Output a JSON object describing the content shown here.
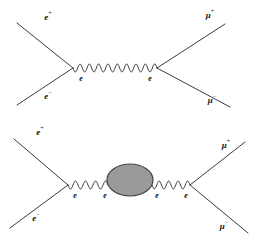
{
  "figure": {
    "width": 258,
    "height": 243,
    "background": "#ffffff",
    "line_color": "#3a3a44",
    "blob_fill": "#9a9a9a",
    "blob_stroke": "#444444",
    "label_color": "#111111"
  },
  "diagrams": [
    {
      "id": "tree-level",
      "name": "tree-level-annihilation",
      "description": "e+ e- annihilation to mu+ mu- via single photon exchange",
      "external_labels": [
        {
          "name": "incoming-positron",
          "base": "e",
          "charge": "+",
          "x": 48,
          "y": 18
        },
        {
          "name": "incoming-electron",
          "base": "e",
          "charge": "−",
          "x": 48,
          "y": 97
        },
        {
          "name": "outgoing-antimuon",
          "base": "μ",
          "charge": "+",
          "x": 210,
          "y": 16
        },
        {
          "name": "outgoing-muon",
          "base": "μ",
          "charge": "−",
          "x": 212,
          "y": 101
        }
      ],
      "vertex_labels": [
        {
          "name": "left-vertex-label",
          "base": "e",
          "charge": "",
          "x": 81,
          "y": 79
        },
        {
          "name": "right-vertex-label",
          "base": "e",
          "charge": "",
          "x": 150,
          "y": 79
        }
      ],
      "fermion_lines": [
        {
          "name": "positron-in-line",
          "x1": 17,
          "y1": 23,
          "x2": 73,
          "y2": 68
        },
        {
          "name": "electron-in-line",
          "x1": 17,
          "y1": 105,
          "x2": 73,
          "y2": 68
        },
        {
          "name": "antimuon-out-line",
          "x1": 157,
          "y1": 68,
          "x2": 225,
          "y2": 24
        },
        {
          "name": "muon-out-line",
          "x1": 157,
          "y1": 68,
          "x2": 230,
          "y2": 107
        }
      ],
      "photon": {
        "name": "photon-propagator",
        "x1": 73,
        "y1": 68,
        "x2": 157,
        "y2": 68,
        "cycles": 9,
        "amplitude": 4
      },
      "vertices": [
        {
          "name": "left-vertex",
          "x": 73,
          "y": 68
        },
        {
          "name": "right-vertex",
          "x": 157,
          "y": 68
        }
      ]
    },
    {
      "id": "loop-corrected",
      "name": "vacuum-polarization-correction",
      "description": "e+ e- to mu+ mu- with a blob insertion in the photon propagator",
      "external_labels": [
        {
          "name": "incoming-positron",
          "base": "e",
          "charge": "+",
          "x": 40,
          "y": 133
        },
        {
          "name": "incoming-electron",
          "base": "e",
          "charge": "−",
          "x": 36,
          "y": 219
        },
        {
          "name": "outgoing-antimuon",
          "base": "μ",
          "charge": "+",
          "x": 226,
          "y": 146
        },
        {
          "name": "outgoing-muon",
          "base": "μ",
          "charge": "−",
          "x": 224,
          "y": 227
        }
      ],
      "vertex_labels": [
        {
          "name": "left-vertex-label",
          "base": "e",
          "charge": "",
          "x": 75,
          "y": 196
        },
        {
          "name": "blob-left-label",
          "base": "e",
          "charge": "",
          "x": 105,
          "y": 196
        },
        {
          "name": "blob-right-label",
          "base": "e",
          "charge": "",
          "x": 157,
          "y": 196
        },
        {
          "name": "right-vertex-label",
          "base": "e",
          "charge": "",
          "x": 186,
          "y": 196
        }
      ],
      "fermion_lines": [
        {
          "name": "positron-in-line",
          "x1": 14,
          "y1": 139,
          "x2": 68,
          "y2": 185
        },
        {
          "name": "electron-in-line",
          "x1": 10,
          "y1": 228,
          "x2": 68,
          "y2": 185
        },
        {
          "name": "antimuon-out-line",
          "x1": 190,
          "y1": 185,
          "x2": 245,
          "y2": 142
        },
        {
          "name": "muon-out-line",
          "x1": 190,
          "y1": 185,
          "x2": 248,
          "y2": 233
        }
      ],
      "photons": [
        {
          "name": "photon-propagator-left",
          "x1": 68,
          "y1": 185,
          "x2": 108,
          "y2": 185,
          "cycles": 4,
          "amplitude": 4
        },
        {
          "name": "photon-propagator-right",
          "x1": 152,
          "y1": 185,
          "x2": 190,
          "y2": 185,
          "cycles": 4,
          "amplitude": 4
        }
      ],
      "blob": {
        "name": "self-energy-blob",
        "cx": 130,
        "cy": 180,
        "rx": 23,
        "ry": 16
      },
      "vertices": [
        {
          "name": "left-vertex",
          "x": 68,
          "y": 185
        },
        {
          "name": "right-vertex",
          "x": 190,
          "y": 185
        }
      ]
    }
  ]
}
